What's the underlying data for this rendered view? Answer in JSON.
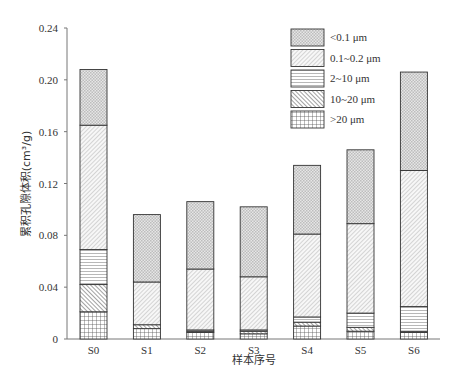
{
  "chart_data": {
    "type": "bar",
    "stacked": true,
    "title": "",
    "xlabel": "样本序号",
    "ylabel": "累积孔隙体积(cm³/g)",
    "ylim": [
      0,
      0.24
    ],
    "yticks": [
      "0",
      "0.04",
      "0.08",
      "0.12",
      "0.16",
      "0.20",
      "0.24"
    ],
    "grid": false,
    "legend_position": "upper right (inside)",
    "categories": [
      "S0",
      "S1",
      "S2",
      "S3",
      "S4",
      "S5",
      "S6"
    ],
    "series": [
      {
        "name": ">20 μm",
        "pattern": "grid",
        "values": [
          0.021,
          0.008,
          0.005,
          0.004,
          0.01,
          0.006,
          0.005
        ]
      },
      {
        "name": "10~20 μm",
        "pattern": "backslash-hatch",
        "values": [
          0.021,
          0.003,
          0.001,
          0.002,
          0.003,
          0.003,
          0.001
        ]
      },
      {
        "name": "2~10 μm",
        "pattern": "horizontal-lines",
        "values": [
          0.027,
          0.0,
          0.001,
          0.001,
          0.004,
          0.011,
          0.019
        ]
      },
      {
        "name": "0.1~0.2 μm",
        "pattern": "forward-hatch",
        "values": [
          0.096,
          0.033,
          0.047,
          0.041,
          0.064,
          0.069,
          0.105
        ]
      },
      {
        "name": "<0.1 μm",
        "pattern": "crosshatch-dense",
        "values": [
          0.043,
          0.052,
          0.052,
          0.054,
          0.053,
          0.057,
          0.076
        ]
      }
    ],
    "cumulative_tops": {
      ">20 μm": [
        0.021,
        0.008,
        0.005,
        0.004,
        0.01,
        0.006,
        0.005
      ],
      "10~20 μm": [
        0.042,
        0.011,
        0.006,
        0.006,
        0.013,
        0.009,
        0.006
      ],
      "2~10 μm": [
        0.069,
        0.011,
        0.007,
        0.007,
        0.017,
        0.02,
        0.025
      ],
      "0.1~0.2 μm": [
        0.165,
        0.044,
        0.054,
        0.048,
        0.081,
        0.089,
        0.13
      ],
      "<0.1 μm": [
        0.208,
        0.096,
        0.106,
        0.102,
        0.134,
        0.146,
        0.206
      ]
    }
  },
  "legend": {
    "items": [
      {
        "label": "<0.1  μm",
        "pattern": "crosshatch-dense"
      },
      {
        "label": "0.1~0.2  μm",
        "pattern": "forward-hatch"
      },
      {
        "label": "2~10  μm",
        "pattern": "horizontal-lines"
      },
      {
        "label": "10~20  μm",
        "pattern": "backslash-hatch"
      },
      {
        "label": ">20  μm",
        "pattern": "grid"
      }
    ]
  },
  "axes": {
    "x_title": "样本序号",
    "y_title": "累积孔隙体积(cm³/g)"
  }
}
